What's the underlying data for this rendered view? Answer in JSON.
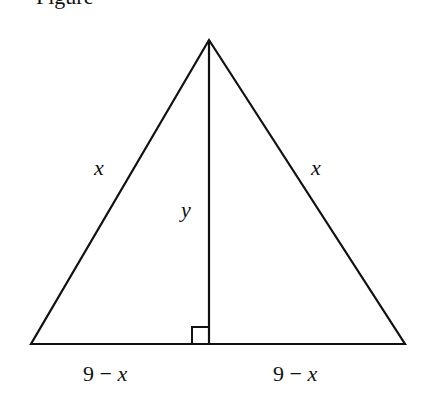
{
  "caption_fragment": "Figure",
  "diagram": {
    "type": "isosceles-triangle-with-altitude",
    "vertices": {
      "apex": [
        209,
        40
      ],
      "left": [
        31,
        344
      ],
      "right": [
        405,
        344
      ],
      "foot": [
        209,
        344
      ]
    },
    "labels": {
      "left_side": "x",
      "right_side": "x",
      "altitude": "y",
      "left_base": "9 − x",
      "left_base_num": "9 − ",
      "left_base_var": "x",
      "right_base_num": "9 − ",
      "right_base_var": "x"
    },
    "right_angle_marker": true,
    "stroke_color": "#111111"
  }
}
